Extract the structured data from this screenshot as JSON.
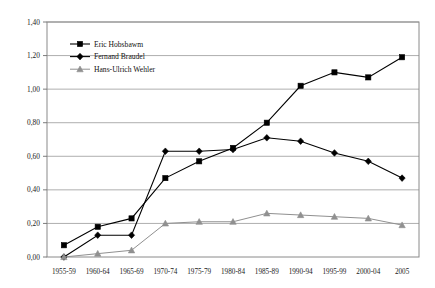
{
  "chart_data": {
    "type": "line",
    "title": "",
    "xlabel": "",
    "ylabel": "",
    "categories": [
      "1955-59",
      "1960-64",
      "1965-69",
      "1970-74",
      "1975-79",
      "1980-84",
      "1985-89",
      "1990-94",
      "1995-99",
      "2000-04",
      "2005"
    ],
    "ylim": [
      0.0,
      1.4
    ],
    "ytick_labels": [
      "0,00",
      "0,20",
      "0,40",
      "0,60",
      "0,80",
      "1,00",
      "1,20",
      "1,40"
    ],
    "ytick_values": [
      0.0,
      0.2,
      0.4,
      0.6,
      0.8,
      1.0,
      1.2,
      1.4
    ],
    "grid": true,
    "legend_position": "top-left-inside",
    "series": [
      {
        "name": "Eric Hobsbawm",
        "marker": "square",
        "color": "#000000",
        "values": [
          0.07,
          0.18,
          0.23,
          0.47,
          0.57,
          0.65,
          0.8,
          1.02,
          1.1,
          1.07,
          1.19
        ]
      },
      {
        "name": "Fernand Braudel",
        "marker": "diamond",
        "color": "#000000",
        "values": [
          0.0,
          0.13,
          0.13,
          0.63,
          0.63,
          0.64,
          0.71,
          0.69,
          0.62,
          0.57,
          0.47
        ]
      },
      {
        "name": "Hans-Ulrich Wehler",
        "marker": "triangle",
        "color": "#909090",
        "values": [
          0.0,
          0.02,
          0.04,
          0.2,
          0.21,
          0.21,
          0.26,
          0.25,
          0.24,
          0.23,
          0.19
        ]
      }
    ]
  },
  "legend": {
    "items": [
      {
        "label": "Eric Hobsbawm",
        "marker": "square-marker-icon",
        "color": "#000000"
      },
      {
        "label": "Fernand Braudel",
        "marker": "diamond-marker-icon",
        "color": "#000000"
      },
      {
        "label": "Hans-Ulrich Wehler",
        "marker": "triangle-marker-icon",
        "color": "#909090"
      }
    ]
  },
  "axes": {
    "frame_color": "#808080",
    "grid_color": "#a6a6a6"
  }
}
